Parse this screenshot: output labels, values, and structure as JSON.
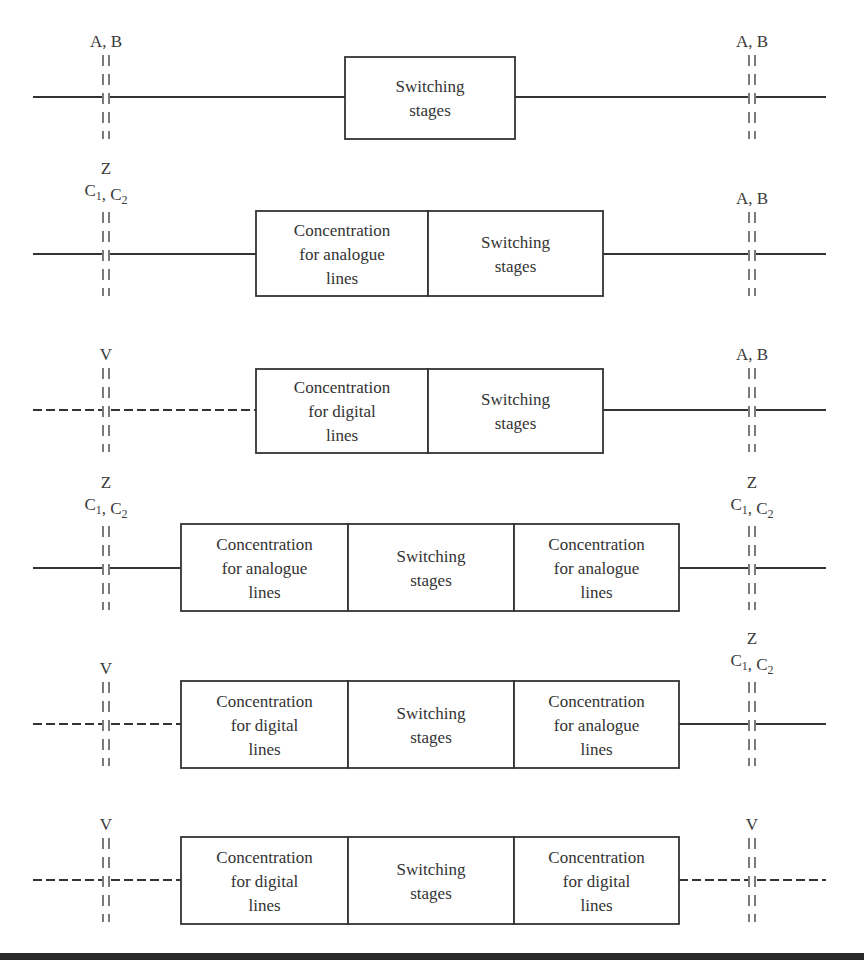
{
  "diagram": {
    "type": "switching-configurations",
    "rows": [
      {
        "y": 97,
        "left_label": [
          "A, B"
        ],
        "left_line": "solid",
        "right_label": [
          "A, B"
        ],
        "right_line": "solid",
        "boxes": [
          {
            "x": 345,
            "w": 170,
            "lines": [
              "Switching",
              "stages"
            ]
          }
        ],
        "box_top": 57,
        "box_bottom": 139
      },
      {
        "y": 254,
        "left_label": [
          "Z",
          "C1, C2"
        ],
        "left_line": "solid",
        "right_label": [
          "A, B"
        ],
        "right_line": "solid",
        "boxes": [
          {
            "x": 256,
            "w": 172,
            "lines": [
              "Concentration",
              "for analogue",
              "lines"
            ]
          },
          {
            "x": 428,
            "w": 175,
            "lines": [
              "Switching",
              "stages"
            ]
          }
        ],
        "box_top": 211,
        "box_bottom": 296
      },
      {
        "y": 410,
        "left_label": [
          "V"
        ],
        "left_line": "dashed",
        "right_label": [
          "A, B"
        ],
        "right_line": "solid",
        "boxes": [
          {
            "x": 256,
            "w": 172,
            "lines": [
              "Concentration",
              "for digital",
              "lines"
            ]
          },
          {
            "x": 428,
            "w": 175,
            "lines": [
              "Switching",
              "stages"
            ]
          }
        ],
        "box_top": 369,
        "box_bottom": 453
      },
      {
        "y": 568,
        "left_label": [
          "Z",
          "C1, C2"
        ],
        "left_line": "solid",
        "right_label": [
          "Z",
          "C1, C2"
        ],
        "right_line": "solid",
        "boxes": [
          {
            "x": 181,
            "w": 167,
            "lines": [
              "Concentration",
              "for analogue",
              "lines"
            ]
          },
          {
            "x": 348,
            "w": 166,
            "lines": [
              "Switching",
              "stages"
            ]
          },
          {
            "x": 514,
            "w": 165,
            "lines": [
              "Concentration",
              "for analogue",
              "lines"
            ]
          }
        ],
        "box_top": 524,
        "box_bottom": 611
      },
      {
        "y": 724,
        "left_label": [
          "V"
        ],
        "left_line": "dashed",
        "right_label": [
          "Z",
          "C1, C2"
        ],
        "right_line": "solid",
        "boxes": [
          {
            "x": 181,
            "w": 167,
            "lines": [
              "Concentration",
              "for digital",
              "lines"
            ]
          },
          {
            "x": 348,
            "w": 166,
            "lines": [
              "Switching",
              "stages"
            ]
          },
          {
            "x": 514,
            "w": 165,
            "lines": [
              "Concentration",
              "for analogue",
              "lines"
            ]
          }
        ],
        "box_top": 681,
        "box_bottom": 768
      },
      {
        "y": 880,
        "left_label": [
          "V"
        ],
        "left_line": "dashed",
        "right_label": [
          "V"
        ],
        "right_line": "dashed",
        "boxes": [
          {
            "x": 181,
            "w": 167,
            "lines": [
              "Concentration",
              "for digital",
              "lines"
            ]
          },
          {
            "x": 348,
            "w": 166,
            "lines": [
              "Switching",
              "stages"
            ]
          },
          {
            "x": 514,
            "w": 165,
            "lines": [
              "Concentration",
              "for digital",
              "lines"
            ]
          }
        ],
        "box_top": 837,
        "box_bottom": 924
      }
    ],
    "left_ref_x": 106,
    "right_ref_x": 752,
    "line_left_x": 33,
    "line_right_x": 826,
    "bottom_rule_y": 956,
    "colors": {
      "stroke": "#333333",
      "text": "#3a3a3a",
      "rule": "#2a2a2a"
    }
  }
}
